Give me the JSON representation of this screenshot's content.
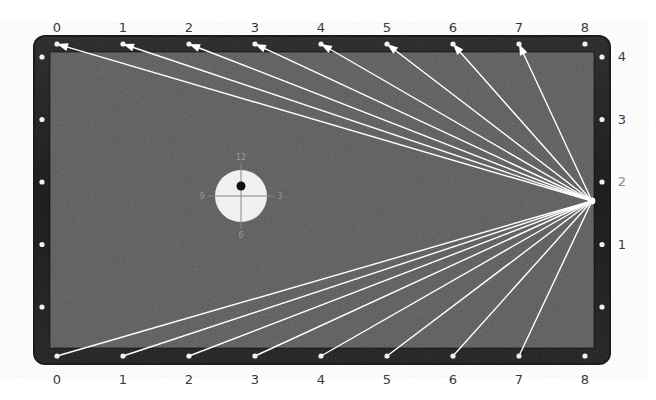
{
  "diagram": {
    "type": "billiards-table-aiming-diagram",
    "title": "",
    "table": {
      "surface_color": "#5a5a5a",
      "rail_color": "#1b1b1b",
      "frame_color": "#111111",
      "diamond_color": "#f2f2f2",
      "line_color": "#ffffff",
      "x": 33,
      "y": 35,
      "width": 578,
      "height": 330,
      "rail_thickness": 17,
      "corner_radius": 12
    },
    "clock": {
      "label": "clock-face",
      "cx": 241,
      "cy": 196,
      "r": 26,
      "face_color": "#f0f0f0",
      "tip_dot_color": "#111111",
      "tip_dot": {
        "dx": 0,
        "dy": -10,
        "r": 4.5
      },
      "marks": [
        {
          "name": "twelve",
          "text": "12",
          "pos": "top"
        },
        {
          "name": "three",
          "text": "3",
          "pos": "right"
        },
        {
          "name": "six",
          "text": "6",
          "pos": "bottom"
        },
        {
          "name": "nine",
          "text": "9",
          "pos": "left"
        }
      ]
    },
    "convergence_point": {
      "x": 592,
      "y": 201,
      "rail": "right",
      "diamond_label": "2"
    },
    "top_labels": [
      "0",
      "1",
      "2",
      "3",
      "4",
      "5",
      "6",
      "7",
      "8"
    ],
    "bottom_labels": [
      "0",
      "1",
      "2",
      "3",
      "4",
      "5",
      "6",
      "7",
      "8"
    ],
    "right_labels": [
      "4",
      "3",
      "2",
      "1"
    ],
    "left_labels": [],
    "top_label_y": 20,
    "bottom_label_y": 372,
    "right_label_x": 622,
    "diamond_x_start": 57,
    "diamond_x_step": 66.0,
    "diamond_count_long": 9,
    "diamond_y_start": 57,
    "diamond_y_step": 62.5,
    "diamond_count_short": 5,
    "top_rail_y": 44,
    "bottom_rail_y": 356,
    "left_rail_x": 42,
    "right_rail_x": 602,
    "top_targets_with_arrows": [
      0,
      1,
      2,
      3,
      4,
      5,
      6,
      7
    ],
    "bottom_targets_plain": [
      0,
      1,
      2,
      3,
      4,
      5,
      6,
      7
    ],
    "arrowhead": {
      "length": 11,
      "width": 8
    },
    "right_label_values_dim": [
      "2"
    ]
  }
}
